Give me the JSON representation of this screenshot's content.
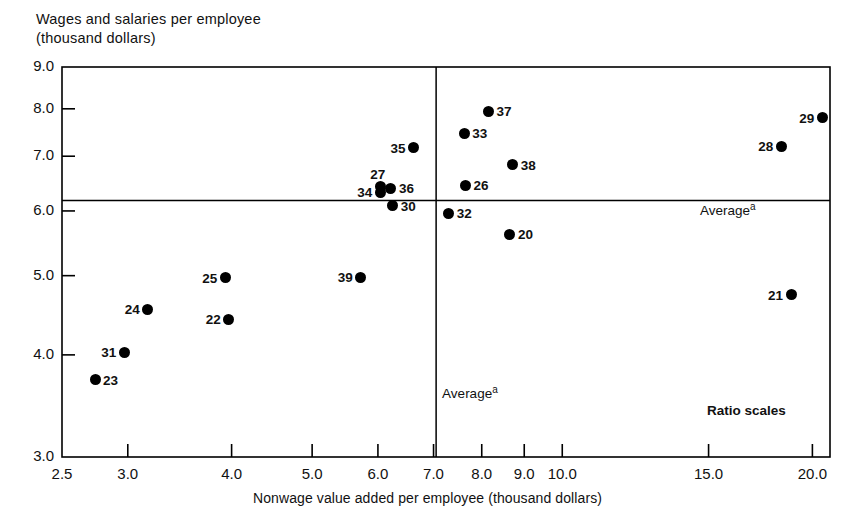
{
  "chart_data": {
    "type": "scatter",
    "title": "",
    "ylabel": "Wages and salaries per employee\n(thousand dollars)",
    "xlabel": "Nonwage value added per employee (thousand dollars)",
    "xscale": "log",
    "yscale": "log",
    "xlim": [
      2.5,
      21.0
    ],
    "ylim": [
      3.0,
      9.0
    ],
    "grid": false,
    "legend": null,
    "note": "Ratio scales",
    "xticks": [
      2.5,
      3.0,
      4.0,
      5.0,
      6.0,
      7.0,
      8.0,
      9.0,
      10.0,
      15.0,
      20.0
    ],
    "xtick_labels": [
      "2.5",
      "3.0",
      "4.0",
      "5.0",
      "6.0",
      "7.0",
      "8.0",
      "9.0",
      "10.0",
      "15.0",
      "20.0"
    ],
    "yticks": [
      3.0,
      4.0,
      5.0,
      6.0,
      7.0,
      8.0,
      9.0
    ],
    "ytick_labels": [
      "3.0",
      "4.0",
      "5.0",
      "6.0",
      "7.0",
      "8.0",
      "9.0"
    ],
    "average_lines": {
      "x_average": 7.05,
      "y_average": 6.18,
      "x_label": "Average",
      "x_label_sup": "a",
      "y_label": "Average",
      "y_label_sup": "a"
    },
    "points": [
      {
        "label": "20",
        "x": 8.65,
        "y": 5.62,
        "label_pos": "right"
      },
      {
        "label": "21",
        "x": 18.85,
        "y": 4.74,
        "label_pos": "left"
      },
      {
        "label": "22",
        "x": 3.97,
        "y": 4.42,
        "label_pos": "left"
      },
      {
        "label": "23",
        "x": 2.74,
        "y": 3.73,
        "label_pos": "right"
      },
      {
        "label": "24",
        "x": 3.17,
        "y": 4.55,
        "label_pos": "left"
      },
      {
        "label": "25",
        "x": 3.93,
        "y": 4.97,
        "label_pos": "left"
      },
      {
        "label": "26",
        "x": 7.65,
        "y": 6.45,
        "label_pos": "right"
      },
      {
        "label": "27",
        "x": 6.04,
        "y": 6.42,
        "label_pos": "above"
      },
      {
        "label": "28",
        "x": 18.35,
        "y": 7.2,
        "label_pos": "left"
      },
      {
        "label": "29",
        "x": 20.55,
        "y": 7.8,
        "label_pos": "left"
      },
      {
        "label": "30",
        "x": 6.25,
        "y": 6.09,
        "label_pos": "right"
      },
      {
        "label": "31",
        "x": 2.97,
        "y": 4.03,
        "label_pos": "left"
      },
      {
        "label": "32",
        "x": 7.3,
        "y": 5.96,
        "label_pos": "right"
      },
      {
        "label": "33",
        "x": 7.62,
        "y": 7.47,
        "label_pos": "right"
      },
      {
        "label": "34",
        "x": 6.04,
        "y": 6.32,
        "label_pos": "left"
      },
      {
        "label": "35",
        "x": 6.62,
        "y": 7.17,
        "label_pos": "left"
      },
      {
        "label": "36",
        "x": 6.22,
        "y": 6.4,
        "label_pos": "right"
      },
      {
        "label": "37",
        "x": 8.15,
        "y": 7.95,
        "label_pos": "right"
      },
      {
        "label": "38",
        "x": 8.72,
        "y": 6.83,
        "label_pos": "right"
      },
      {
        "label": "39",
        "x": 5.72,
        "y": 4.98,
        "label_pos": "left"
      }
    ]
  }
}
